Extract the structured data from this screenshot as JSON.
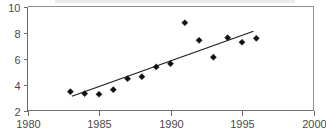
{
  "chart_data": {
    "type": "scatter",
    "title": "",
    "xlabel": "",
    "ylabel": "",
    "xlim": [
      1980,
      2000
    ],
    "ylim": [
      2,
      10
    ],
    "xticks": [
      1980,
      1985,
      1990,
      1995,
      2000
    ],
    "yticks": [
      2,
      4,
      6,
      8,
      10
    ],
    "xtick_labels": [
      "1980",
      "1985",
      "1990",
      "1995",
      "2000"
    ],
    "ytick_labels": [
      "2",
      "4",
      "6",
      "8",
      "10"
    ],
    "grid": false,
    "legend": null,
    "series": [
      {
        "name": "observations",
        "marker": "diamond",
        "color": "#111111",
        "x": [
          1983,
          1984,
          1985,
          1986,
          1987,
          1988,
          1989,
          1990,
          1991,
          1992,
          1993,
          1994,
          1995,
          1996
        ],
        "values": [
          3.45,
          3.3,
          3.25,
          3.6,
          4.45,
          4.6,
          5.35,
          5.6,
          8.75,
          7.4,
          6.1,
          7.6,
          7.25,
          7.55
        ]
      },
      {
        "name": "trend-line",
        "type": "line",
        "color": "#1a1a1a",
        "x": [
          1983.1,
          1995.8
        ],
        "values": [
          3.1,
          8.1
        ]
      }
    ]
  },
  "axes": {
    "y_axis_name": "value-axis",
    "x_axis_name": "year-axis"
  }
}
